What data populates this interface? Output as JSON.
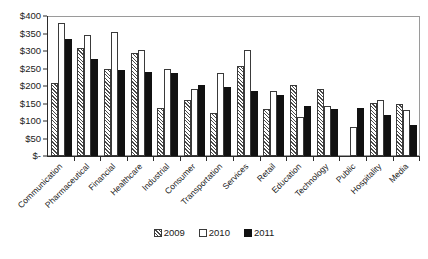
{
  "chart_data": {
    "type": "bar",
    "title": "",
    "xlabel": "",
    "ylabel": "",
    "ylim": [
      0,
      400
    ],
    "grid": false,
    "legend_position": "bottom-center",
    "ytick_labels": [
      "$400",
      "$350",
      "$300",
      "$250",
      "$200",
      "$150",
      "$100",
      "$50",
      "$-"
    ],
    "ytick_values": [
      400,
      350,
      300,
      250,
      200,
      150,
      100,
      50,
      0
    ],
    "categories": [
      "Communication",
      "Pharmaceutical",
      "Financial",
      "Healthcare",
      "Industrial",
      "Consumer",
      "Transportation",
      "Services",
      "Retail",
      "Education",
      "Technology",
      "Public",
      "Hospitality",
      "Media"
    ],
    "series": [
      {
        "name": "2009",
        "values": [
          208,
          310,
          249,
          293,
          137,
          159,
          122,
          257,
          134,
          203,
          191,
          null,
          152,
          149
        ]
      },
      {
        "name": "2010",
        "values": [
          379,
          346,
          353,
          302,
          249,
          192,
          236,
          302,
          185,
          112,
          144,
          82,
          159,
          131
        ]
      },
      {
        "name": "2011",
        "values": [
          334,
          277,
          247,
          240,
          236,
          203,
          196,
          185,
          175,
          142,
          135,
          136,
          117,
          90
        ]
      }
    ]
  },
  "legend": {
    "items": [
      {
        "label": "2009"
      },
      {
        "label": "2010"
      },
      {
        "label": "2011"
      }
    ]
  },
  "colors": {
    "series_2009": "#ffffff",
    "series_2009_hatch": "#4a4a4a",
    "series_2010": "#ffffff",
    "series_2011": "#111111",
    "axis": "#2b2b2b",
    "frame": "#9a9a9a",
    "background": "#ffffff",
    "text": "#1a1a1a"
  }
}
